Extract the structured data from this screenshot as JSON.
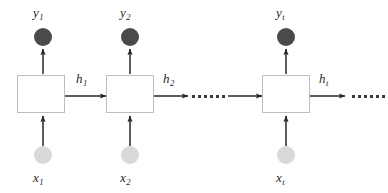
{
  "diagram": {
    "colors": {
      "output_node": "#4a4a4a",
      "input_node": "#d9d9d9",
      "box_border": "#bdbdbd",
      "box_fill": "#ffffff",
      "arrow": "#262626",
      "background": "#ffffff",
      "text": "#262626"
    },
    "cells": [
      {
        "id": "timestep-1",
        "box_label": "",
        "output_label": "y",
        "output_subscript": "1",
        "input_label": "x",
        "input_subscript": "1",
        "hidden_label": "h",
        "hidden_subscript": "1"
      },
      {
        "id": "timestep-2",
        "box_label": "",
        "output_label": "y",
        "output_subscript": "2",
        "input_label": "x",
        "input_subscript": "2",
        "hidden_label": "h",
        "hidden_subscript": "2"
      },
      {
        "id": "timestep-t",
        "box_label": "",
        "output_label": "y",
        "output_subscript": "t",
        "input_label": "x",
        "input_subscript": "t",
        "hidden_label": "h",
        "hidden_subscript": "t"
      }
    ],
    "ellipsis": {
      "middle": "......",
      "trailing": "......",
      "dot_count": 6
    }
  }
}
